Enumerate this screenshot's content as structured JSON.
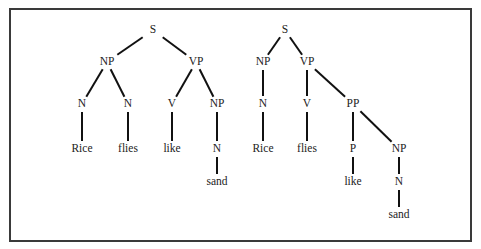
{
  "figure": {
    "border_color": "#3a3a3a",
    "line_color": "#111111",
    "text_color": "#222222"
  },
  "trees": [
    {
      "name": "parse-tree-1",
      "sentence": "Rice flies like sand",
      "nodes": [
        {
          "id": "s",
          "label": "S",
          "x": 153,
          "y": 30
        },
        {
          "id": "np",
          "label": "NP",
          "x": 107,
          "y": 62
        },
        {
          "id": "vp",
          "label": "VP",
          "x": 196,
          "y": 62
        },
        {
          "id": "n1",
          "label": "N",
          "x": 82,
          "y": 104
        },
        {
          "id": "n2",
          "label": "N",
          "x": 128,
          "y": 104
        },
        {
          "id": "v",
          "label": "V",
          "x": 172,
          "y": 104
        },
        {
          "id": "np2",
          "label": "NP",
          "x": 217,
          "y": 104
        },
        {
          "id": "w_rice",
          "label": "Rice",
          "x": 82,
          "y": 149
        },
        {
          "id": "w_flies",
          "label": "flies",
          "x": 128,
          "y": 149
        },
        {
          "id": "w_like",
          "label": "like",
          "x": 172,
          "y": 149
        },
        {
          "id": "n3",
          "label": "N",
          "x": 217,
          "y": 149
        },
        {
          "id": "w_sand",
          "label": "sand",
          "x": 217,
          "y": 182
        }
      ],
      "edges": [
        [
          "s",
          "np"
        ],
        [
          "s",
          "vp"
        ],
        [
          "np",
          "n1"
        ],
        [
          "np",
          "n2"
        ],
        [
          "vp",
          "v"
        ],
        [
          "vp",
          "np2"
        ],
        [
          "n1",
          "w_rice"
        ],
        [
          "n2",
          "w_flies"
        ],
        [
          "v",
          "w_like"
        ],
        [
          "np2",
          "n3"
        ],
        [
          "n3",
          "w_sand"
        ]
      ]
    },
    {
      "name": "parse-tree-2",
      "sentence": "Rice flies like sand",
      "nodes": [
        {
          "id": "s",
          "label": "S",
          "x": 285,
          "y": 30
        },
        {
          "id": "np",
          "label": "NP",
          "x": 263,
          "y": 62
        },
        {
          "id": "vp",
          "label": "VP",
          "x": 307,
          "y": 62
        },
        {
          "id": "n1",
          "label": "N",
          "x": 263,
          "y": 104
        },
        {
          "id": "v",
          "label": "V",
          "x": 307,
          "y": 104
        },
        {
          "id": "pp",
          "label": "PP",
          "x": 353,
          "y": 104
        },
        {
          "id": "w_rice",
          "label": "Rice",
          "x": 263,
          "y": 149
        },
        {
          "id": "w_flies",
          "label": "flies",
          "x": 307,
          "y": 149
        },
        {
          "id": "p",
          "label": "P",
          "x": 353,
          "y": 149
        },
        {
          "id": "np2",
          "label": "NP",
          "x": 399,
          "y": 149
        },
        {
          "id": "w_like",
          "label": "like",
          "x": 353,
          "y": 182
        },
        {
          "id": "n2",
          "label": "N",
          "x": 399,
          "y": 182
        },
        {
          "id": "w_sand",
          "label": "sand",
          "x": 399,
          "y": 215
        }
      ],
      "edges": [
        [
          "s",
          "np"
        ],
        [
          "s",
          "vp"
        ],
        [
          "np",
          "n1"
        ],
        [
          "vp",
          "v"
        ],
        [
          "vp",
          "pp"
        ],
        [
          "n1",
          "w_rice"
        ],
        [
          "v",
          "w_flies"
        ],
        [
          "pp",
          "p"
        ],
        [
          "pp",
          "np2"
        ],
        [
          "p",
          "w_like"
        ],
        [
          "np2",
          "n2"
        ],
        [
          "n2",
          "w_sand"
        ]
      ]
    }
  ]
}
